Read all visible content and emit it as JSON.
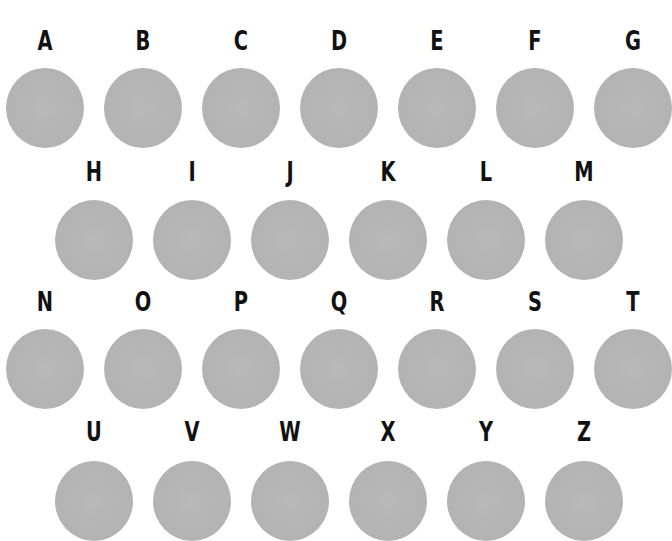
{
  "colors": {
    "background": "#ffffff",
    "dot": "#b5b5b5",
    "letter": "#111111"
  },
  "rows": [
    {
      "label_y": 26,
      "dot_y": 68,
      "items": [
        {
          "letter": "A",
          "x": 45
        },
        {
          "letter": "B",
          "x": 143
        },
        {
          "letter": "C",
          "x": 241
        },
        {
          "letter": "D",
          "x": 339
        },
        {
          "letter": "E",
          "x": 437
        },
        {
          "letter": "F",
          "x": 535
        },
        {
          "letter": "G",
          "x": 633
        }
      ]
    },
    {
      "label_y": 157,
      "dot_y": 200,
      "items": [
        {
          "letter": "H",
          "x": 94
        },
        {
          "letter": "I",
          "x": 192
        },
        {
          "letter": "J",
          "x": 290
        },
        {
          "letter": "K",
          "x": 388
        },
        {
          "letter": "L",
          "x": 486
        },
        {
          "letter": "M",
          "x": 584
        }
      ]
    },
    {
      "label_y": 287,
      "dot_y": 329,
      "items": [
        {
          "letter": "N",
          "x": 45
        },
        {
          "letter": "O",
          "x": 143
        },
        {
          "letter": "P",
          "x": 241
        },
        {
          "letter": "Q",
          "x": 339
        },
        {
          "letter": "R",
          "x": 437
        },
        {
          "letter": "S",
          "x": 535
        },
        {
          "letter": "T",
          "x": 633
        }
      ]
    },
    {
      "label_y": 417,
      "dot_y": 461,
      "items": [
        {
          "letter": "U",
          "x": 94
        },
        {
          "letter": "V",
          "x": 192
        },
        {
          "letter": "W",
          "x": 290
        },
        {
          "letter": "X",
          "x": 388
        },
        {
          "letter": "Y",
          "x": 486
        },
        {
          "letter": "Z",
          "x": 584
        }
      ]
    }
  ]
}
